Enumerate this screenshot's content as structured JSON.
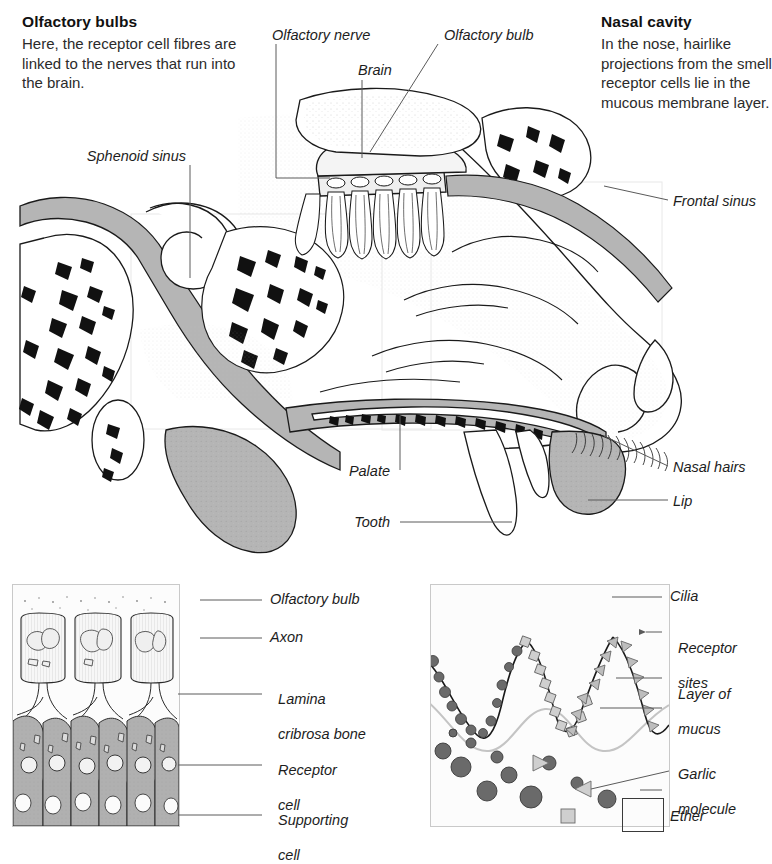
{
  "figure": {
    "style": "engraved line art with stippled shading"
  },
  "captions": [
    {
      "id": "olfactory-bulbs",
      "title": "Olfactory bulbs",
      "body": "Here, the receptor cell fibres are linked to the nerves that run into the brain."
    },
    {
      "id": "nasal-cavity",
      "title": "Nasal cavity",
      "body": "In the nose, hairlike projections from the smell receptor cells lie in the mucous membrane layer."
    }
  ],
  "main_labels": [
    {
      "id": "olfactory-nerve",
      "text": "Olfactory nerve"
    },
    {
      "id": "brain",
      "text": "Brain"
    },
    {
      "id": "olfactory-bulb",
      "text": "Olfactory bulb"
    },
    {
      "id": "sphenoid-sinus",
      "text": "Sphenoid sinus"
    },
    {
      "id": "frontal-sinus",
      "text": "Frontal sinus"
    },
    {
      "id": "nasal-hairs",
      "text": "Nasal hairs"
    },
    {
      "id": "lip",
      "text": "Lip"
    },
    {
      "id": "palate",
      "text": "Palate"
    },
    {
      "id": "tooth",
      "text": "Tooth"
    }
  ],
  "panel_left": {
    "id": "olfactory-epithelium-panel",
    "labels": [
      {
        "id": "olfactory-bulb",
        "line1": "Olfactory bulb",
        "line2": ""
      },
      {
        "id": "axon",
        "line1": "Axon",
        "line2": ""
      },
      {
        "id": "lamina-cribrosa-bone",
        "line1": "Lamina",
        "line2": "cribrosa bone"
      },
      {
        "id": "receptor-cell",
        "line1": "Receptor",
        "line2": "cell"
      },
      {
        "id": "supporting-cell",
        "line1": "Supporting",
        "line2": "cell"
      }
    ]
  },
  "panel_right": {
    "id": "receptor-sites-panel",
    "labels": [
      {
        "id": "cilia",
        "line1": "Cilia",
        "line2": ""
      },
      {
        "id": "receptor-sites",
        "line1": "Receptor",
        "line2": "sites"
      },
      {
        "id": "layer-of-mucus",
        "line1": "Layer of",
        "line2": "mucus"
      },
      {
        "id": "garlic-molecule",
        "line1": "Garlic",
        "line2": "molecule"
      },
      {
        "id": "ether",
        "line1": "Ether",
        "line2": ""
      }
    ]
  },
  "colors": {
    "ink": "#1a1a1a",
    "leader": "#5a5a5a",
    "tissue_gray": "#b5b5b5",
    "mucosa_gray": "#a8a8a8",
    "molecule_dark": "#6a6a6a",
    "molecule_light": "#c9c9c9",
    "panel_border": "#c9c9c9",
    "paper": "#ffffff"
  }
}
